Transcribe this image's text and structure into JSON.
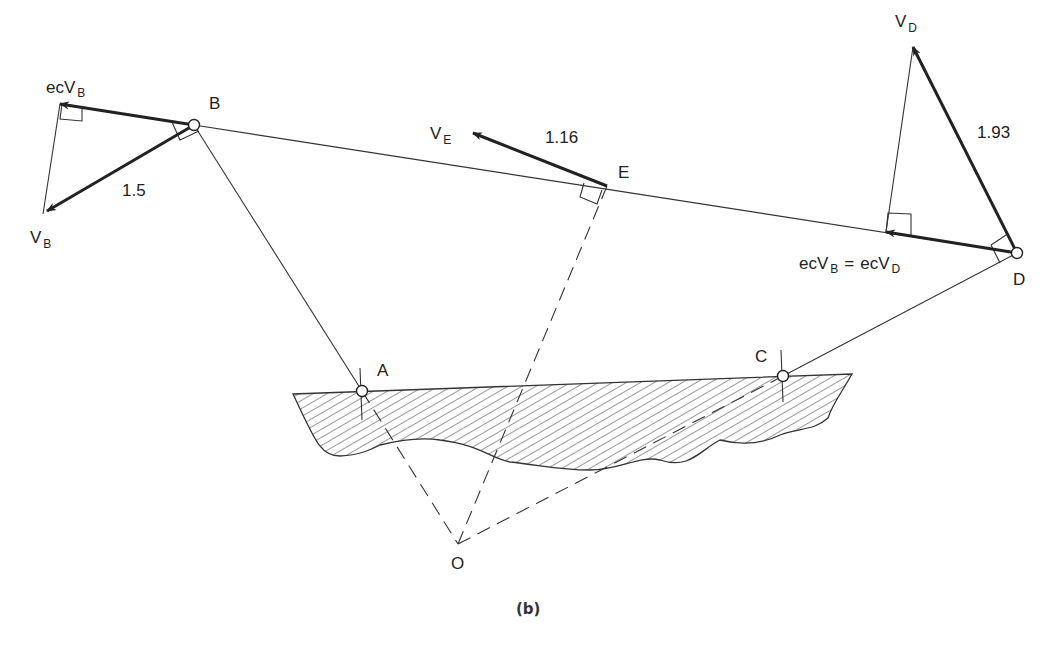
{
  "caption": "(b)",
  "points": {
    "A": {
      "label": "A",
      "x": 362,
      "y": 391
    },
    "B": {
      "label": "B",
      "x": 194,
      "y": 125
    },
    "C": {
      "label": "C",
      "x": 783,
      "y": 376
    },
    "D": {
      "label": "D",
      "x": 1017,
      "y": 253
    },
    "E": {
      "label": "E",
      "x": 607,
      "y": 186
    },
    "O": {
      "label": "O",
      "x": 458,
      "y": 544
    }
  },
  "vectors": {
    "vB": {
      "base": "V",
      "sub": "B",
      "magnitude": "1.5"
    },
    "ecvB": {
      "prefix": "ecV",
      "sub": "B"
    },
    "vE": {
      "base": "V",
      "sub": "E",
      "magnitude": "1.16"
    },
    "vD": {
      "base": "V",
      "sub": "D",
      "magnitude": "1.93"
    },
    "ecEq": {
      "lhs_prefix": "ecV",
      "lhs_sub": "B",
      "eq": "=",
      "rhs_prefix": "ecV",
      "rhs_sub": "D"
    }
  }
}
